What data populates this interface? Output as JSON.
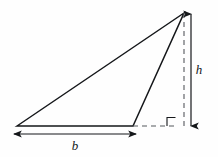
{
  "figure": {
    "name": "triangle-base-height-diagram",
    "type": "geometry-diagram",
    "background_color": "#fefefe",
    "stroke_color": "#15171a",
    "dashed_color": "#4a4d52",
    "width": 218,
    "height": 157
  },
  "labels": {
    "base": "b",
    "height": "h"
  },
  "shapes": {
    "triangle": {
      "name": "obtuse-triangle",
      "vertices": [
        {
          "name": "left-base-vertex",
          "x": 17,
          "y": 126
        },
        {
          "name": "right-base-vertex",
          "x": 133,
          "y": 126
        },
        {
          "name": "apex-vertex",
          "x": 184,
          "y": 13
        }
      ]
    },
    "base_extension": {
      "name": "dashed-base-extension",
      "x1": 133,
      "y1": 126,
      "x2": 174,
      "y2": 126,
      "style": "dashed"
    },
    "altitude": {
      "name": "dashed-altitude-line",
      "x1": 184,
      "y1": 13,
      "x2": 184,
      "y2": 126,
      "style": "dashed"
    },
    "right_angle_marker": {
      "name": "right-angle-square",
      "x": 167,
      "y": 117,
      "size": 9
    }
  },
  "dimensions": {
    "height_arrow": {
      "name": "height-dimension-arrow",
      "orientation": "vertical",
      "x": 191,
      "y_top": 13,
      "y_bottom": 127,
      "label": "h",
      "label_x": 199,
      "label_y": 74
    },
    "base_arrow": {
      "name": "base-dimension-arrow",
      "orientation": "horizontal",
      "y": 134,
      "x_left": 13,
      "x_right": 137,
      "label": "b",
      "label_x": 75,
      "label_y": 149
    }
  }
}
